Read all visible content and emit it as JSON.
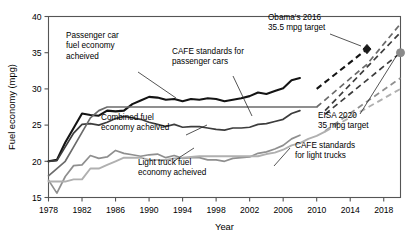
{
  "chart_data": {
    "type": "line",
    "title": "",
    "xlabel": "Year",
    "ylabel": "Fuel economy (mpg)",
    "xlim": [
      1978,
      2020
    ],
    "ylim": [
      15,
      40
    ],
    "xticks": [
      1978,
      1982,
      1986,
      1990,
      1994,
      1998,
      2002,
      2006,
      2010,
      2014,
      2018
    ],
    "yticks": [
      15,
      20,
      25,
      30,
      35,
      40
    ],
    "grid": false,
    "legend_position": "none",
    "colors": {
      "passenger_car_achieved": "#141414",
      "combined_achieved": "#3d3d3d",
      "light_truck_achieved": "#8f8f8f",
      "cafe_passenger_cars": "#6b6b6b",
      "cafe_light_trucks": "#b0b0b0",
      "axis": "#555555",
      "marker_obama": "#1a1a1a",
      "marker_eisa": "#8a8a8a"
    },
    "series": [
      {
        "name": "Passenger car fuel economy acheived",
        "style": "solid",
        "color_key": "passenger_car_achieved",
        "x": [
          1978,
          1979,
          1980,
          1981,
          1982,
          1983,
          1984,
          1985,
          1986,
          1987,
          1988,
          1989,
          1990,
          1991,
          1992,
          1993,
          1994,
          1995,
          1996,
          1997,
          1998,
          1999,
          2000,
          2001,
          2002,
          2003,
          2004,
          2005,
          2006,
          2007,
          2008
        ],
        "y": [
          20.0,
          20.2,
          22.6,
          24.6,
          26.6,
          26.4,
          26.3,
          27.0,
          26.9,
          27.0,
          27.9,
          28.4,
          28.9,
          28.8,
          28.5,
          28.6,
          28.3,
          28.6,
          28.5,
          28.7,
          28.6,
          28.3,
          28.5,
          28.7,
          29.0,
          29.5,
          29.3,
          29.7,
          30.1,
          31.2,
          31.5
        ]
      },
      {
        "name": "Combined fuel economy acheived",
        "style": "solid",
        "color_key": "combined_achieved",
        "x": [
          1978,
          1979,
          1980,
          1981,
          1982,
          1983,
          1984,
          1985,
          1986,
          1987,
          1988,
          1989,
          1990,
          1991,
          1992,
          1993,
          1994,
          1995,
          1996,
          1997,
          1998,
          1999,
          2000,
          2001,
          2002,
          2003,
          2004,
          2005,
          2006,
          2007,
          2008
        ],
        "y": [
          20.0,
          20.1,
          22.0,
          23.9,
          25.1,
          25.2,
          25.0,
          25.4,
          25.9,
          26.2,
          26.0,
          25.8,
          25.4,
          25.1,
          24.8,
          25.1,
          24.7,
          24.8,
          24.8,
          24.6,
          24.4,
          24.3,
          24.6,
          24.6,
          24.7,
          25.1,
          25.2,
          25.5,
          25.8,
          26.6,
          27.0
        ]
      },
      {
        "name": "Light truck fuel economy acheived",
        "style": "solid",
        "color_key": "light_truck_achieved",
        "x": [
          1978,
          1979,
          1980,
          1981,
          1982,
          1983,
          1984,
          1985,
          1986,
          1987,
          1988,
          1989,
          1990,
          1991,
          1992,
          1993,
          1994,
          1995,
          1996,
          1997,
          1998,
          1999,
          2000,
          2001,
          2002,
          2003,
          2004,
          2005,
          2006,
          2007,
          2008
        ],
        "y": [
          17.4,
          15.6,
          17.9,
          19.4,
          19.5,
          20.8,
          20.4,
          20.6,
          21.5,
          21.1,
          20.9,
          20.7,
          20.9,
          21.0,
          20.5,
          20.8,
          20.4,
          20.5,
          20.5,
          20.2,
          20.2,
          20.0,
          20.4,
          20.5,
          20.6,
          21.1,
          21.3,
          21.7,
          22.2,
          23.1,
          23.6
        ]
      },
      {
        "name": "CAFE standards for passenger cars",
        "style": "solid-then-dashed",
        "color_key": "cafe_passenger_cars",
        "x": [
          1978,
          1979,
          1980,
          1981,
          1982,
          1983,
          1984,
          1985,
          1986,
          1987,
          1988,
          1989,
          1990,
          1991,
          1992,
          1993,
          1994,
          1995,
          1996,
          1997,
          1998,
          1999,
          2000,
          2001,
          2002,
          2003,
          2004,
          2005,
          2006,
          2007,
          2008,
          2009,
          2010
        ],
        "y": [
          18.0,
          19.0,
          20.0,
          22.0,
          24.0,
          26.0,
          27.0,
          27.5,
          27.5,
          27.5,
          27.5,
          27.5,
          27.5,
          27.5,
          27.5,
          27.5,
          27.5,
          27.5,
          27.5,
          27.5,
          27.5,
          27.5,
          27.5,
          27.5,
          27.5,
          27.5,
          27.5,
          27.5,
          27.5,
          27.5,
          27.5,
          27.5,
          27.5
        ]
      },
      {
        "name": "CAFE standards for light trucks",
        "style": "solid-then-dashed",
        "color_key": "cafe_light_trucks",
        "x": [
          1978,
          1979,
          1980,
          1981,
          1982,
          1983,
          1984,
          1985,
          1986,
          1987,
          1988,
          1989,
          1990,
          1991,
          1992,
          1993,
          1994,
          1995,
          1996,
          1997,
          1998,
          1999,
          2000,
          2001,
          2002,
          2003,
          2004,
          2005,
          2006,
          2007,
          2008,
          2009,
          2010,
          2011
        ],
        "y": [
          17.2,
          17.2,
          17.2,
          17.5,
          17.5,
          19.0,
          19.0,
          19.5,
          20.0,
          20.5,
          20.5,
          20.5,
          20.2,
          20.2,
          20.2,
          20.4,
          20.5,
          20.6,
          20.7,
          20.7,
          20.7,
          20.7,
          20.7,
          20.7,
          20.7,
          20.7,
          21.0,
          21.2,
          21.6,
          22.2,
          22.5,
          23.1,
          23.5,
          24.1
        ]
      }
    ],
    "projections": [
      {
        "name": "passenger car projection upper",
        "style": "dashed",
        "color_key": "passenger_car_achieved",
        "x": [
          2010,
          2016
        ],
        "y": [
          30.0,
          35.5
        ]
      },
      {
        "name": "cafe passenger cars projection",
        "style": "dashed",
        "color_key": "cafe_passenger_cars",
        "x": [
          2010,
          2016,
          2020
        ],
        "y": [
          27.5,
          33.4,
          39.0
        ]
      },
      {
        "name": "combined projection",
        "style": "dashed",
        "color_key": "combined_achieved",
        "x": [
          2011,
          2020
        ],
        "y": [
          27.0,
          37.8
        ]
      },
      {
        "name": "combined to eisa target",
        "style": "dashed",
        "color_key": "combined_achieved",
        "x": [
          2011,
          2020
        ],
        "y": [
          26.5,
          35.0
        ]
      },
      {
        "name": "light truck projection",
        "style": "dashed",
        "color_key": "light_truck_achieved",
        "x": [
          2011,
          2020
        ],
        "y": [
          24.2,
          31.5
        ]
      },
      {
        "name": "cafe light trucks projection",
        "style": "dashed",
        "color_key": "cafe_light_trucks",
        "x": [
          2011,
          2020
        ],
        "y": [
          24.1,
          30.0
        ]
      }
    ],
    "markers": [
      {
        "name": "obama-2016-target",
        "shape": "diamond",
        "x": 2016,
        "y": 35.5,
        "color_key": "marker_obama"
      },
      {
        "name": "eisa-2020-target",
        "shape": "circle",
        "x": 2020,
        "y": 35.0,
        "color_key": "marker_eisa"
      }
    ],
    "annotations": [
      {
        "id": "passenger-car-achieved",
        "lines": [
          "Passenger car",
          "fuel economy",
          "acheived"
        ],
        "text_x": 66,
        "text_y": 38,
        "leader": [
          [
            138,
            72
          ],
          [
            176,
            98
          ]
        ]
      },
      {
        "id": "cafe-passenger-cars",
        "lines": [
          "CAFE standards for",
          "passenger cars"
        ],
        "text_x": 172,
        "text_y": 54,
        "leader": [
          [
            233,
            76
          ],
          [
            252,
            116
          ]
        ]
      },
      {
        "id": "combined-achieved",
        "lines": [
          "Combined fuel",
          "economy acheived"
        ],
        "text_x": 101,
        "text_y": 120,
        "leader": [
          [
            186,
            135
          ],
          [
            207,
            125
          ]
        ]
      },
      {
        "id": "light-truck-achieved",
        "lines": [
          "Light truck fuel",
          "economy acheived"
        ],
        "text_x": 138,
        "text_y": 165,
        "leader": [
          [
            174,
            161
          ],
          [
            194,
            148
          ]
        ]
      },
      {
        "id": "obama-2016-target",
        "lines": [
          "Obama's 2016",
          "35.5 mpg target"
        ],
        "text_x": 268,
        "text_y": 20,
        "leader": [
          [
            330,
            34
          ],
          [
            361,
            46
          ]
        ]
      },
      {
        "id": "eisa-2020-target",
        "lines": [
          "EISA 2020",
          "35 mpg target"
        ],
        "text_x": 318,
        "text_y": 118,
        "leader": [
          [
            360,
            114
          ],
          [
            397,
            55
          ]
        ]
      },
      {
        "id": "cafe-light-trucks",
        "lines": [
          "CAFE standards",
          "for light trucks"
        ],
        "text_x": 295,
        "text_y": 148,
        "leader": [
          [
            290,
            148
          ],
          [
            274,
            166
          ]
        ]
      }
    ]
  },
  "axes": {
    "x_label": "Year",
    "y_label": "Fuel economy (mpg)",
    "x_tick_labels": [
      "1978",
      "1982",
      "1986",
      "1990",
      "1994",
      "1998",
      "2002",
      "2006",
      "2010",
      "2014",
      "2018"
    ],
    "y_tick_labels": [
      "15",
      "20",
      "25",
      "30",
      "35",
      "40"
    ]
  }
}
